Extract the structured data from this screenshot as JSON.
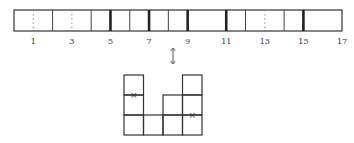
{
  "strip": {
    "x0": 14,
    "x1": 342,
    "y0": 10,
    "y1": 31,
    "cells": 17,
    "boundaries": [
      {
        "index": 1,
        "style": "dotted"
      },
      {
        "index": 2,
        "style": "thin"
      },
      {
        "index": 3,
        "style": "dotted"
      },
      {
        "index": 4,
        "style": "thin"
      },
      {
        "index": 5,
        "style": "thick"
      },
      {
        "index": 6,
        "style": "thin"
      },
      {
        "index": 7,
        "style": "thick"
      },
      {
        "index": 8,
        "style": "thin"
      },
      {
        "index": 9,
        "style": "thick"
      },
      {
        "index": 11,
        "style": "thick"
      },
      {
        "index": 12,
        "style": "thin"
      },
      {
        "index": 13,
        "style": "dotted"
      },
      {
        "index": 14,
        "style": "thin"
      },
      {
        "index": 15,
        "style": "thick"
      }
    ],
    "labels": [
      "1",
      "3",
      "5",
      "7",
      "9",
      "11",
      "13",
      "15",
      "17"
    ],
    "label_indices": [
      1,
      3,
      5,
      7,
      9,
      11,
      13,
      15,
      17
    ]
  },
  "arrow": {
    "glyph": "↕",
    "x": 173,
    "y0": 48,
    "y1": 64
  },
  "diagram": {
    "x0": 124,
    "cell_w": 19.5,
    "cell_h": 20,
    "bottom": 135,
    "column_heights": [
      3,
      1,
      2,
      3
    ],
    "marks": [
      {
        "col": 0,
        "line_y": 95,
        "glyph": "×"
      },
      {
        "col": 3,
        "line_y": 115,
        "glyph": "×"
      }
    ]
  }
}
